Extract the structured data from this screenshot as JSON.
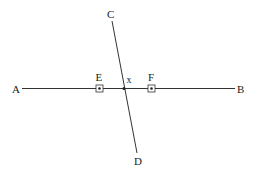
{
  "diagram": {
    "lines": [
      {
        "name": "line-ab",
        "from": "A",
        "to": "B"
      },
      {
        "name": "line-cd",
        "from": "C",
        "to": "D"
      }
    ],
    "labels": {
      "A": "A",
      "B": "B",
      "C": "C",
      "D": "D",
      "E": "E",
      "F": "F",
      "intersection": "x"
    },
    "marked_points": [
      {
        "name": "E",
        "marker": "boxed-dot",
        "on": "line-ab"
      },
      {
        "name": "F",
        "marker": "boxed-dot",
        "on": "line-ab"
      }
    ],
    "intersection": {
      "label": "x",
      "of": [
        "line-ab",
        "line-cd"
      ],
      "marker": "dot"
    },
    "colors": {
      "stroke": "#333333",
      "text": "#222222",
      "background": "#ffffff"
    }
  }
}
